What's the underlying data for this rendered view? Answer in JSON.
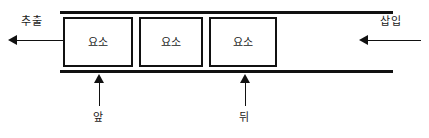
{
  "diagram": {
    "stroke_color": "#111111",
    "background_color": "#ffffff",
    "elements": [
      {
        "label": "요소"
      },
      {
        "label": "요소"
      },
      {
        "label": "요소"
      }
    ],
    "annotations": {
      "extract": {
        "label": "추출",
        "arrow_direction": "left",
        "position": "left-outside"
      },
      "insert": {
        "label": "삽입",
        "arrow_direction": "left",
        "position": "right-outside"
      },
      "front": {
        "label": "앞",
        "arrow_direction": "up",
        "position": "below-first-element"
      },
      "rear": {
        "label": "뒤",
        "arrow_direction": "up",
        "position": "below-third-element"
      }
    }
  }
}
